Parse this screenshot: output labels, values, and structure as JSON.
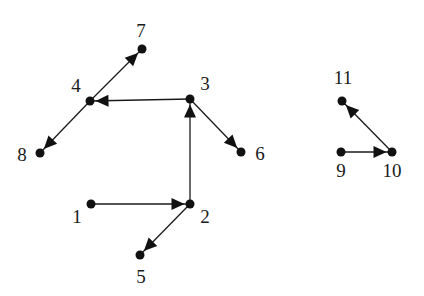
{
  "diagram": {
    "type": "directed-graph",
    "node_radius": 4.5,
    "colors": {
      "node": "#111111",
      "edge": "#1a1a1a",
      "background": "#ffffff"
    },
    "nodes": [
      {
        "id": "1",
        "label": "1",
        "x": 91,
        "y": 204,
        "lx": 77,
        "ly": 223
      },
      {
        "id": "2",
        "label": "2",
        "x": 190,
        "y": 204,
        "lx": 205,
        "ly": 223
      },
      {
        "id": "3",
        "label": "3",
        "x": 190,
        "y": 99,
        "lx": 205,
        "ly": 90
      },
      {
        "id": "4",
        "label": "4",
        "x": 90,
        "y": 101,
        "lx": 76,
        "ly": 92
      },
      {
        "id": "5",
        "label": "5",
        "x": 140,
        "y": 255,
        "lx": 141,
        "ly": 283
      },
      {
        "id": "6",
        "label": "6",
        "x": 241,
        "y": 152,
        "lx": 260,
        "ly": 160
      },
      {
        "id": "7",
        "label": "7",
        "x": 142,
        "y": 49,
        "lx": 141,
        "ly": 37
      },
      {
        "id": "8",
        "label": "8",
        "x": 40,
        "y": 153,
        "lx": 22,
        "ly": 161
      },
      {
        "id": "9",
        "label": "9",
        "x": 341,
        "y": 152,
        "lx": 341,
        "ly": 177
      },
      {
        "id": "10",
        "label": "10",
        "x": 392,
        "y": 152,
        "lx": 392,
        "ly": 177
      },
      {
        "id": "11",
        "label": "11",
        "x": 342,
        "y": 101,
        "lx": 343,
        "ly": 84
      }
    ],
    "edges": [
      {
        "from": "1",
        "to": "2"
      },
      {
        "from": "2",
        "to": "3"
      },
      {
        "from": "2",
        "to": "5"
      },
      {
        "from": "3",
        "to": "4"
      },
      {
        "from": "3",
        "to": "6"
      },
      {
        "from": "4",
        "to": "7"
      },
      {
        "from": "4",
        "to": "8"
      },
      {
        "from": "9",
        "to": "10"
      },
      {
        "from": "10",
        "to": "11"
      }
    ]
  }
}
